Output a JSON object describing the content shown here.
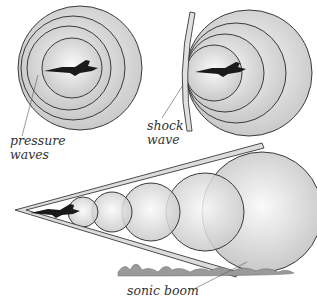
{
  "diagram": {
    "panels": [
      {
        "id": "subsonic",
        "description": "Jet inside concentric pressure waves"
      },
      {
        "id": "sonic",
        "description": "Jet at speed of sound with shock wave in front"
      },
      {
        "id": "supersonic",
        "description": "Jet ahead of waves producing Mach cone and sonic boom"
      }
    ],
    "labels": {
      "pressure_line1": "pressure",
      "pressure_line2": "waves",
      "shock_line1": "shock",
      "shock_line2": "wave",
      "sonic_boom": "sonic boom"
    },
    "colors": {
      "wave_fill": "#e6e6e6",
      "wave_stroke": "#3a3a3a",
      "jet": "#1a1a1a",
      "ground": "#8a8a8a"
    }
  }
}
